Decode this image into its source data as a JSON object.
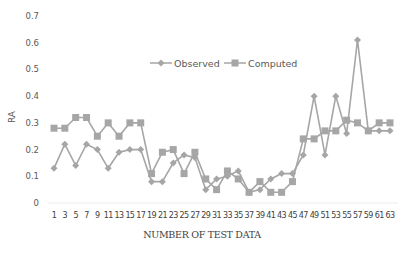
{
  "chart_data": {
    "type": "line",
    "title": "",
    "xlabel": "NUMBER OF TEST DATA",
    "ylabel": "RA",
    "ylim": [
      0,
      0.7
    ],
    "yticks": [
      "0",
      "0.1",
      "0.2",
      "0.3",
      "0.4",
      "0.5",
      "0.6",
      "0.7"
    ],
    "grid": false,
    "legend_position": "top-center-inside",
    "categories": [
      "1",
      "3",
      "5",
      "7",
      "9",
      "11",
      "13",
      "15",
      "17",
      "19",
      "21",
      "23",
      "25",
      "27",
      "29",
      "31",
      "33",
      "35",
      "37",
      "39",
      "41",
      "43",
      "45",
      "47",
      "49",
      "51",
      "53",
      "55",
      "57",
      "59",
      "61",
      "63"
    ],
    "series": [
      {
        "name": "Observed",
        "marker": "diamond",
        "color": "#a6a6a6",
        "values": [
          0.13,
          0.22,
          0.14,
          0.22,
          0.2,
          0.13,
          0.19,
          0.2,
          0.2,
          0.08,
          0.08,
          0.15,
          0.18,
          0.17,
          0.05,
          0.09,
          0.1,
          0.12,
          0.04,
          0.05,
          0.09,
          0.11,
          0.11,
          0.18,
          0.4,
          0.18,
          0.4,
          0.26,
          0.61,
          0.27,
          0.27,
          0.27
        ]
      },
      {
        "name": "Computed",
        "marker": "square",
        "color": "#a6a6a6",
        "values": [
          0.28,
          0.28,
          0.32,
          0.32,
          0.25,
          0.3,
          0.25,
          0.3,
          0.3,
          0.11,
          0.19,
          0.2,
          0.11,
          0.19,
          0.09,
          0.05,
          0.12,
          0.09,
          0.04,
          0.08,
          0.04,
          0.04,
          0.08,
          0.24,
          0.24,
          0.27,
          0.27,
          0.31,
          0.3,
          0.27,
          0.3,
          0.3
        ]
      }
    ]
  }
}
